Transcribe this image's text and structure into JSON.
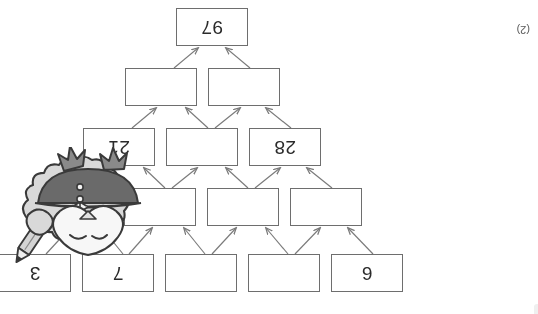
{
  "page": {
    "rotation_degrees": 180,
    "background_color": "#ffffff",
    "mark_allocation": "(2)"
  },
  "pyramid": {
    "type": "addition-number-pyramid",
    "border_color": "#6e6e6e",
    "text_color": "#2b2b2b",
    "rows": [
      {
        "row_index": 1,
        "cells": [
          {
            "value": "6",
            "filled": true
          },
          {
            "value": "",
            "filled": false
          },
          {
            "value": "",
            "filled": false
          },
          {
            "value": "7",
            "filled": true
          },
          {
            "value": "3",
            "filled": true
          }
        ]
      },
      {
        "row_index": 2,
        "cells": [
          {
            "value": "",
            "filled": false
          },
          {
            "value": "",
            "filled": false
          },
          {
            "value": "",
            "filled": false
          },
          {
            "value": "",
            "filled": false
          }
        ]
      },
      {
        "row_index": 3,
        "cells": [
          {
            "value": "28",
            "filled": true
          },
          {
            "value": "",
            "filled": false
          },
          {
            "value": "21",
            "filled": true
          }
        ]
      },
      {
        "row_index": 4,
        "cells": [
          {
            "value": "",
            "filled": false
          },
          {
            "value": "",
            "filled": false
          }
        ]
      },
      {
        "row_index": 5,
        "cells": [
          {
            "value": "97",
            "filled": true
          }
        ]
      }
    ]
  },
  "mascot": {
    "description": "cartoon-character-holding-pencil",
    "body_color": "#d8d8d8",
    "cap_color": "#6a6a6a",
    "outline_color": "#3a3a3a",
    "face_color": "#f6f6f6",
    "pencil_color": "#cfcfcf"
  }
}
